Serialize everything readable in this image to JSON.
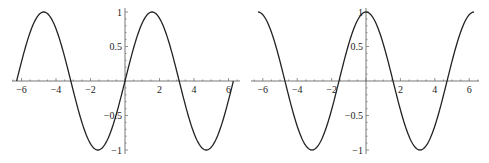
{
  "chart_data": [
    {
      "type": "line",
      "title": "",
      "function": "sin(x)",
      "xlabel": "",
      "ylabel": "",
      "xlim": [
        -6.283,
        6.283
      ],
      "ylim": [
        -1,
        1
      ],
      "grid": false,
      "legend": null,
      "x_ticks": [
        -6,
        -4,
        -2,
        2,
        4,
        6
      ],
      "x_tick_labels": [
        "−6",
        "−4",
        "−2",
        "2",
        "4",
        "6"
      ],
      "y_ticks": [
        -1,
        -0.5,
        0.5,
        1
      ],
      "y_tick_labels": [
        "−1",
        "−0.5",
        "0.5",
        "1"
      ],
      "series": [
        {
          "name": "sin(x)",
          "x": [
            -6.283,
            -4.712,
            -3.142,
            -1.571,
            0,
            1.571,
            3.142,
            4.712,
            6.283
          ],
          "y": [
            0,
            1,
            0,
            -1,
            0,
            1,
            0,
            -1,
            0
          ]
        }
      ]
    },
    {
      "type": "line",
      "title": "",
      "function": "cos(x)",
      "xlabel": "",
      "ylabel": "",
      "xlim": [
        -6.283,
        6.283
      ],
      "ylim": [
        -1,
        1
      ],
      "grid": false,
      "legend": null,
      "x_ticks": [
        -6,
        -4,
        -2,
        2,
        4,
        6
      ],
      "x_tick_labels": [
        "−6",
        "−4",
        "−2",
        "2",
        "4",
        "6"
      ],
      "y_ticks": [
        -1,
        -0.5,
        0.5,
        1
      ],
      "y_tick_labels": [
        "−1",
        "−0.5",
        "0.5",
        "1"
      ],
      "series": [
        {
          "name": "cos(x)",
          "x": [
            -6.283,
            -4.712,
            -3.142,
            -1.571,
            0,
            1.571,
            3.142,
            4.712,
            6.283
          ],
          "y": [
            1,
            0,
            -1,
            0,
            1,
            0,
            -1,
            0,
            1
          ]
        }
      ]
    }
  ]
}
